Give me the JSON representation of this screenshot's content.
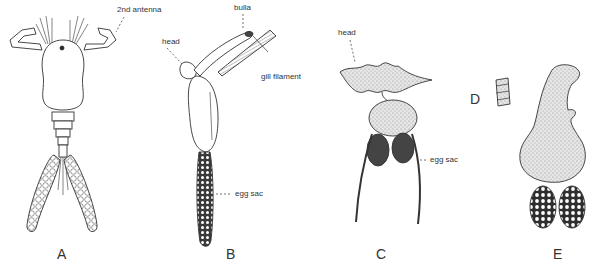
{
  "figure": {
    "panels": [
      {
        "id": "A",
        "letter": "A",
        "labels": [
          "2nd antenna"
        ]
      },
      {
        "id": "B",
        "letter": "B",
        "labels": [
          "head",
          "bulla",
          "gill filament",
          "egg sac"
        ]
      },
      {
        "id": "C",
        "letter": "C",
        "labels": [
          "head",
          "egg sac"
        ]
      },
      {
        "id": "D",
        "letter": "D",
        "labels": []
      },
      {
        "id": "E",
        "letter": "E",
        "labels": []
      }
    ],
    "annotations": {
      "a_antenna": "2nd antenna",
      "b_head": "head",
      "b_bulla": "bulla",
      "b_gill": "gill filament",
      "b_eggsac": "egg sac",
      "c_head": "head",
      "c_eggsac": "egg sac"
    },
    "letters": {
      "a": "A",
      "b": "B",
      "c": "C",
      "d": "D",
      "e": "E"
    },
    "colors": {
      "ink": "#333333",
      "fill_light": "#f2f2f2",
      "fill_dark": "#444444",
      "background": "#ffffff"
    }
  }
}
